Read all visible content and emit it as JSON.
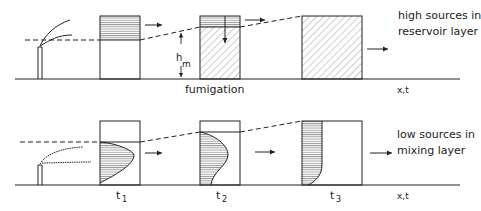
{
  "top_panel": {
    "description_line1": "high sources in",
    "description_line2": "reservoir layer",
    "process_label": "fumigation",
    "height_label_h": "h",
    "height_label_sub": "m",
    "axis_label": "x,t"
  },
  "bottom_panel": {
    "description_line1": "low sources in",
    "description_line2": "mixing layer",
    "time_labels": [
      "t",
      "t",
      "t"
    ],
    "time_subscripts": [
      "1",
      "2",
      "3"
    ],
    "axis_label": "x,t"
  },
  "colors": {
    "ink": "#222222",
    "background": "#ffffff"
  }
}
